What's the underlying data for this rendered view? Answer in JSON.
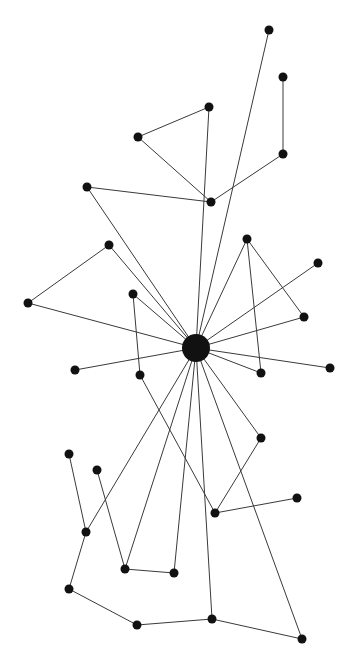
{
  "diagram": {
    "type": "network-graph",
    "width": 343,
    "height": 665,
    "colors": {
      "node": "#111111",
      "edge": "#3a3a3a",
      "background": "#ffffff"
    },
    "hub": {
      "id": "hub",
      "x": 196,
      "y": 348,
      "r": 14
    },
    "nodes": [
      {
        "id": "n1",
        "x": 269,
        "y": 30
      },
      {
        "id": "n2",
        "x": 283,
        "y": 77
      },
      {
        "id": "n3",
        "x": 209,
        "y": 107
      },
      {
        "id": "n4",
        "x": 138,
        "y": 137
      },
      {
        "id": "n5",
        "x": 283,
        "y": 154
      },
      {
        "id": "n6",
        "x": 87,
        "y": 187
      },
      {
        "id": "n7",
        "x": 211,
        "y": 202
      },
      {
        "id": "n8",
        "x": 109,
        "y": 245
      },
      {
        "id": "n9",
        "x": 247,
        "y": 239
      },
      {
        "id": "n10",
        "x": 318,
        "y": 263
      },
      {
        "id": "n11",
        "x": 28,
        "y": 303
      },
      {
        "id": "n12",
        "x": 133,
        "y": 294
      },
      {
        "id": "n13",
        "x": 304,
        "y": 317
      },
      {
        "id": "n14",
        "x": 75,
        "y": 370
      },
      {
        "id": "n15",
        "x": 140,
        "y": 375
      },
      {
        "id": "n16",
        "x": 261,
        "y": 373
      },
      {
        "id": "n17",
        "x": 330,
        "y": 368
      },
      {
        "id": "n18",
        "x": 261,
        "y": 438
      },
      {
        "id": "n19",
        "x": 69,
        "y": 454
      },
      {
        "id": "n20",
        "x": 97,
        "y": 470
      },
      {
        "id": "n21",
        "x": 297,
        "y": 498
      },
      {
        "id": "n22",
        "x": 215,
        "y": 513
      },
      {
        "id": "n23",
        "x": 86,
        "y": 532
      },
      {
        "id": "n24",
        "x": 125,
        "y": 569
      },
      {
        "id": "n25",
        "x": 174,
        "y": 573
      },
      {
        "id": "n26",
        "x": 69,
        "y": 589
      },
      {
        "id": "n27",
        "x": 137,
        "y": 625
      },
      {
        "id": "n28",
        "x": 212,
        "y": 619
      },
      {
        "id": "n29",
        "x": 302,
        "y": 639
      }
    ],
    "edges": [
      [
        "hub",
        "n1"
      ],
      [
        "n2",
        "n5"
      ],
      [
        "n3",
        "n4"
      ],
      [
        "hub",
        "n3"
      ],
      [
        "n4",
        "n7"
      ],
      [
        "n6",
        "n7"
      ],
      [
        "n7",
        "n5"
      ],
      [
        "hub",
        "n6"
      ],
      [
        "n8",
        "n11"
      ],
      [
        "n8",
        "hub"
      ],
      [
        "n11",
        "hub"
      ],
      [
        "n12",
        "hub"
      ],
      [
        "n12",
        "n15"
      ],
      [
        "hub",
        "n9"
      ],
      [
        "n9",
        "n13"
      ],
      [
        "n9",
        "n16"
      ],
      [
        "hub",
        "n10"
      ],
      [
        "hub",
        "n13"
      ],
      [
        "hub",
        "n14"
      ],
      [
        "hub",
        "n16"
      ],
      [
        "hub",
        "n17"
      ],
      [
        "hub",
        "n18"
      ],
      [
        "n18",
        "n22"
      ],
      [
        "n15",
        "n22"
      ],
      [
        "n22",
        "n21"
      ],
      [
        "hub",
        "n23"
      ],
      [
        "n19",
        "n23"
      ],
      [
        "n23",
        "n26"
      ],
      [
        "n20",
        "n24"
      ],
      [
        "hub",
        "n24"
      ],
      [
        "n24",
        "n25"
      ],
      [
        "hub",
        "n25"
      ],
      [
        "hub",
        "n28"
      ],
      [
        "n26",
        "n27"
      ],
      [
        "n27",
        "n28"
      ],
      [
        "n28",
        "n29"
      ],
      [
        "hub",
        "n29"
      ]
    ]
  }
}
